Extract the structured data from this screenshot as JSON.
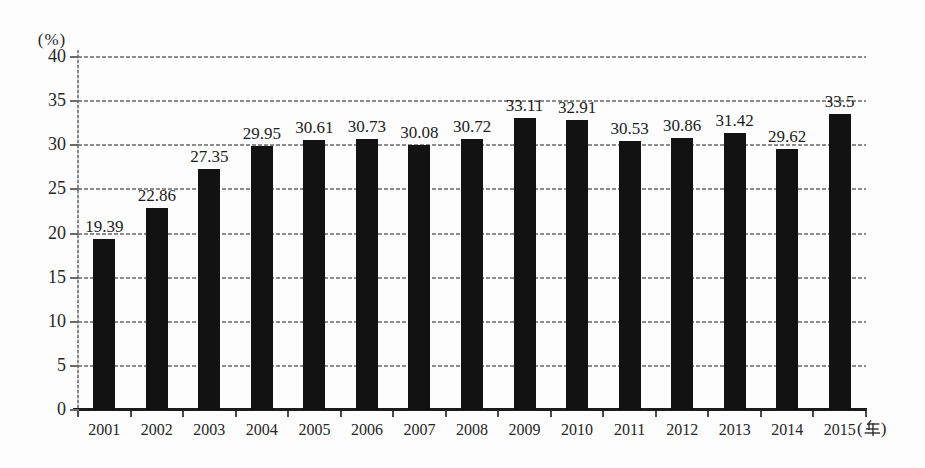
{
  "chart_data": {
    "type": "bar",
    "title": "",
    "categories": [
      "2001",
      "2002",
      "2003",
      "2004",
      "2005",
      "2006",
      "2007",
      "2008",
      "2009",
      "2010",
      "2011",
      "2012",
      "2013",
      "2014",
      "2015"
    ],
    "values": [
      19.39,
      22.86,
      27.35,
      29.95,
      30.61,
      30.73,
      30.08,
      30.72,
      33.11,
      32.91,
      30.53,
      30.86,
      31.42,
      29.62,
      33.5
    ],
    "ylabel": "(%)",
    "xlabel": "",
    "ylim": [
      0,
      40
    ],
    "yticks": [
      0,
      5,
      10,
      15,
      20,
      25,
      30,
      35,
      40
    ],
    "grid": true,
    "legend": false,
    "bar_color": "#121212",
    "gridline_color": "#8c8c8c",
    "x_axis_unit": {
      "text": "(年)",
      "open": "(",
      "close": ")"
    }
  }
}
